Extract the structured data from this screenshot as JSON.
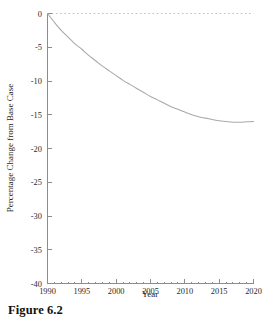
{
  "figure": {
    "caption": "Figure 6.2"
  },
  "chart_data": {
    "type": "line",
    "title": "",
    "subtitle": "",
    "xlabel": "Year",
    "ylabel": "Percentage Change from Base Case",
    "xlim": [
      1990,
      2020
    ],
    "ylim": [
      -40,
      0
    ],
    "grid": false,
    "legend": null,
    "legend_position": "none",
    "xticks": [
      1990,
      1995,
      2000,
      2005,
      2010,
      2015,
      2020
    ],
    "xtick_labels": [
      "1990",
      "1995",
      "2000",
      "2005",
      "2010",
      "2015",
      "2020"
    ],
    "yticks": [
      0,
      -5,
      -10,
      -15,
      -20,
      -25,
      -30,
      -35,
      -40
    ],
    "ytick_labels": [
      "0",
      "-5",
      "-10",
      "-15",
      "-20",
      "-25",
      "-30",
      "-35",
      "-40"
    ],
    "annotations": [
      {
        "name": "zero-reference-line",
        "type": "horizontal-line",
        "value": 0,
        "style": "dotted",
        "color": "#b9b9b9"
      }
    ],
    "series": [
      {
        "name": "Percentage Change from Base Case",
        "color": "#a9a9a9",
        "x": [
          1990,
          1991,
          1992,
          1993,
          1994,
          1995,
          1996,
          1997,
          1998,
          1999,
          2000,
          2001,
          2002,
          2003,
          2004,
          2005,
          2006,
          2007,
          2008,
          2009,
          2010,
          2011,
          2012,
          2013,
          2014,
          2015,
          2016,
          2017,
          2018,
          2019,
          2020
        ],
        "values": [
          0.0,
          -1.3,
          -2.5,
          -3.5,
          -4.5,
          -5.3,
          -6.2,
          -7.0,
          -7.8,
          -8.5,
          -9.2,
          -9.9,
          -10.5,
          -11.1,
          -11.7,
          -12.3,
          -12.8,
          -13.3,
          -13.8,
          -14.2,
          -14.6,
          -15.0,
          -15.3,
          -15.5,
          -15.7,
          -15.9,
          -16.0,
          -16.1,
          -16.1,
          -16.05,
          -16.0
        ]
      }
    ]
  }
}
